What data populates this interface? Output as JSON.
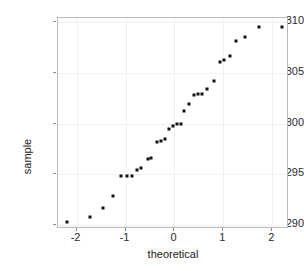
{
  "chart_data": {
    "type": "scatter",
    "title": "",
    "xlabel": "theoretical",
    "ylabel": "sample",
    "xlim": [
      -2.38,
      2.34
    ],
    "ylim": [
      289.6,
      310.4
    ],
    "grid": true,
    "legend": "none",
    "x_ticks": [
      -2,
      -1,
      0,
      1,
      2
    ],
    "x_tick_labels": [
      "-2",
      "-1",
      "0",
      "1",
      "2"
    ],
    "y_ticks": [
      290,
      295,
      300,
      305,
      310
    ],
    "y_tick_labels": [
      "290",
      "295",
      "300",
      "305",
      "310"
    ],
    "series": [
      {
        "name": "sample quantiles",
        "marker": "filled-square",
        "color": "#111111",
        "points": [
          {
            "x": -2.2,
            "y": 290.3
          },
          {
            "x": -1.72,
            "y": 290.8
          },
          {
            "x": -1.47,
            "y": 291.7
          },
          {
            "x": -1.26,
            "y": 292.9
          },
          {
            "x": -1.09,
            "y": 294.8
          },
          {
            "x": -0.97,
            "y": 294.8
          },
          {
            "x": -0.87,
            "y": 294.8
          },
          {
            "x": -0.76,
            "y": 295.4
          },
          {
            "x": -0.68,
            "y": 295.6
          },
          {
            "x": -0.55,
            "y": 296.5
          },
          {
            "x": -0.47,
            "y": 296.6
          },
          {
            "x": -0.36,
            "y": 298.2
          },
          {
            "x": -0.28,
            "y": 298.3
          },
          {
            "x": -0.2,
            "y": 298.5
          },
          {
            "x": -0.12,
            "y": 299.5
          },
          {
            "x": -0.04,
            "y": 299.8
          },
          {
            "x": 0.05,
            "y": 300.0
          },
          {
            "x": 0.13,
            "y": 300.0
          },
          {
            "x": 0.2,
            "y": 301.2
          },
          {
            "x": 0.29,
            "y": 301.9
          },
          {
            "x": 0.4,
            "y": 302.8
          },
          {
            "x": 0.48,
            "y": 302.9
          },
          {
            "x": 0.56,
            "y": 302.9
          },
          {
            "x": 0.66,
            "y": 303.4
          },
          {
            "x": 0.8,
            "y": 304.2
          },
          {
            "x": 0.93,
            "y": 306.1
          },
          {
            "x": 1.02,
            "y": 306.3
          },
          {
            "x": 1.13,
            "y": 306.7
          },
          {
            "x": 1.26,
            "y": 308.1
          },
          {
            "x": 1.45,
            "y": 308.5
          },
          {
            "x": 1.72,
            "y": 309.5
          },
          {
            "x": 2.2,
            "y": 309.5
          }
        ]
      }
    ]
  },
  "axes": {
    "x_title": "theoretical",
    "y_title": "sample"
  }
}
